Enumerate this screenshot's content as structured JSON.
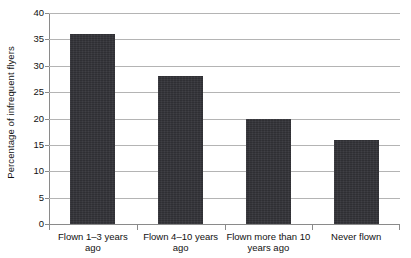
{
  "chart_data": {
    "type": "bar",
    "title": "",
    "xlabel": "",
    "ylabel": "Percentage of infrequent flyers",
    "categories": [
      "Flown 1–3 years ago",
      "Flown 4–10 years ago",
      "Flown more than 10 years ago",
      "Never flown"
    ],
    "values": [
      36,
      28,
      20,
      16
    ],
    "ylim": [
      0,
      40
    ],
    "ytick_labels": [
      "0",
      "5",
      "10",
      "15",
      "20",
      "25",
      "30",
      "35",
      "40"
    ],
    "ytick_values": [
      0,
      5,
      10,
      15,
      20,
      25,
      30,
      35,
      40
    ],
    "ytick_interval": 5,
    "grid": true,
    "grid_axis": "y",
    "legend": false,
    "legend_position": "none",
    "bar_color": "#333338",
    "gridline_color": "#b4b4b4",
    "axis_color": "#8a8a8a",
    "background_color": "#ffffff",
    "text_color": "#111111"
  }
}
